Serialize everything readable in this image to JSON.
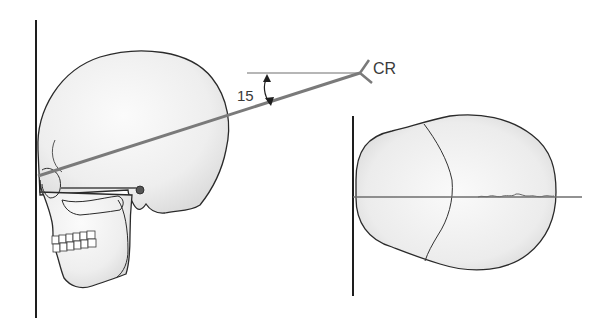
{
  "labels": {
    "cr": "CR",
    "angle": "15"
  },
  "colors": {
    "background": "#ffffff",
    "outline": "#2a2a2a",
    "central_ray": "#7a7a7a",
    "reference_line": "#6e6e6e",
    "skull_fill": "#f4f4f4",
    "skull_shade": "#dedede"
  },
  "views": [
    {
      "name": "lateral-skull-view",
      "description": "Lateral view of skull against image receptor with central ray angled 15 degrees"
    },
    {
      "name": "superior-skull-view",
      "description": "Top-down view of skull against image receptor with midsagittal reference line"
    }
  ]
}
